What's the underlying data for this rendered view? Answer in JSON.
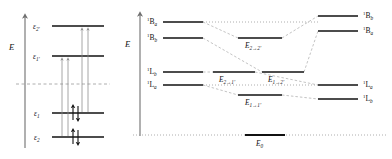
{
  "figure": {
    "type": "energy-level-diagram"
  },
  "left_panel": {
    "axis_label": "E",
    "name": "orbital-energy-panel",
    "levels": [
      {
        "id": "eps2p",
        "label": "ε",
        "sub": "2'",
        "y": 26,
        "x1": 52,
        "x2": 104,
        "occupancy": "virtual"
      },
      {
        "id": "eps1p",
        "label": "ε",
        "sub": "1'",
        "y": 56,
        "x1": 52,
        "x2": 104,
        "occupancy": "virtual"
      },
      {
        "id": "eps1",
        "label": "ε",
        "sub": "1",
        "y": 113,
        "x1": 52,
        "x2": 104,
        "occupancy": "filled"
      },
      {
        "id": "eps2",
        "label": "ε",
        "sub": "2",
        "y": 137,
        "x1": 52,
        "x2": 104,
        "occupancy": "filled"
      }
    ],
    "reference_line": {
      "name": "fermi-dashed-line",
      "y": 84,
      "x1": 16,
      "x2": 110
    },
    "transitions": [
      {
        "id": "t1",
        "from": "eps2",
        "to": "eps1p",
        "x": 62
      },
      {
        "id": "t2",
        "from": "eps2",
        "to": "eps1p",
        "x": 68
      },
      {
        "id": "t3",
        "from": "eps1",
        "to": "eps2p",
        "x": 82
      },
      {
        "id": "t4",
        "from": "eps1",
        "to": "eps2p",
        "x": 88
      }
    ],
    "electron_pairs": [
      {
        "level": "eps1",
        "x": 75
      },
      {
        "level": "eps2",
        "x": 75
      }
    ]
  },
  "right_panel": {
    "axis_label": "E",
    "name": "configuration-interaction-panel",
    "left_states": [
      {
        "id": "1Ba",
        "sup": "1",
        "letter": "B",
        "sub": "a",
        "y": 22,
        "x1": 163,
        "x2": 203
      },
      {
        "id": "1Bb",
        "sup": "1",
        "letter": "B",
        "sub": "b",
        "y": 38,
        "x1": 163,
        "x2": 203
      },
      {
        "id": "1Lb",
        "sup": "1",
        "letter": "L",
        "sub": "b",
        "y": 72,
        "x1": 163,
        "x2": 203
      },
      {
        "id": "1La",
        "sup": "1",
        "letter": "L",
        "sub": "a",
        "y": 85,
        "x1": 163,
        "x2": 203
      }
    ],
    "middle_states": [
      {
        "id": "E22p",
        "label": "E",
        "sub": "2→2'",
        "y": 38,
        "x1": 238,
        "x2": 282
      },
      {
        "id": "E21p",
        "label": "E",
        "sub": "2→1'",
        "y": 72,
        "x1": 213,
        "x2": 255
      },
      {
        "id": "E12p",
        "label": "E",
        "sub": "1→2'",
        "y": 72,
        "x1": 262,
        "x2": 304
      },
      {
        "id": "E11p",
        "label": "E",
        "sub": "1→1'",
        "y": 95,
        "x1": 238,
        "x2": 282
      }
    ],
    "right_states": [
      {
        "id": "1Bb_r",
        "sup": "1",
        "letter": "B",
        "sub": "b",
        "y": 16,
        "x1": 318,
        "x2": 358
      },
      {
        "id": "1Ba_r",
        "sup": "1",
        "letter": "B",
        "sub": "a",
        "y": 31,
        "x1": 318,
        "x2": 358
      },
      {
        "id": "1La_r",
        "sup": "1",
        "letter": "L",
        "sub": "a",
        "y": 85,
        "x1": 318,
        "x2": 358
      },
      {
        "id": "1Lb_r",
        "sup": "1",
        "letter": "L",
        "sub": "b",
        "y": 99,
        "x1": 318,
        "x2": 358
      }
    ],
    "ground_state": {
      "id": "E0",
      "label": "E",
      "sub": "0",
      "y": 135,
      "x1": 245,
      "x2": 285,
      "baseline_x1": 133,
      "baseline_x2": 388
    }
  },
  "colors": {
    "level_stroke": "#111111",
    "axis": "#6f6f6f",
    "dashed_connector": "#b4b4b4",
    "reference_dash": "#9a9a9a",
    "transition_arrow": "#8a8a8a",
    "background": "#ffffff"
  }
}
